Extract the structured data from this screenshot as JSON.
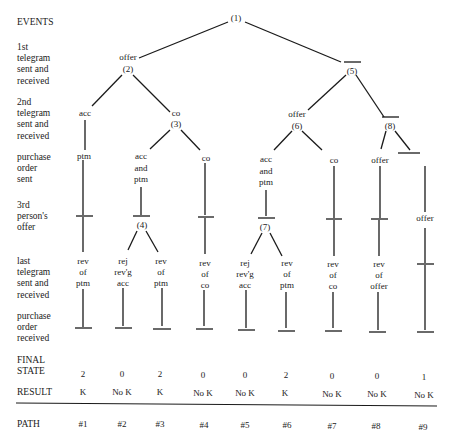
{
  "row_labels": {
    "events": "EVENTS",
    "first_telegram": [
      "1st",
      "telegram",
      "sent and",
      "received"
    ],
    "second_telegram": [
      "2nd",
      "telegram",
      "sent and",
      "received"
    ],
    "po_sent": [
      "purchase",
      "order",
      "sent"
    ],
    "third_offer": [
      "3rd",
      "person's",
      "offer"
    ],
    "last_telegram": [
      "last",
      "telegram",
      "sent and",
      "received"
    ],
    "po_received": [
      "purchase",
      "order",
      "received"
    ],
    "final_state": [
      "FINAL",
      "STATE"
    ],
    "result": "RESULT",
    "path": "PATH"
  },
  "nodes": {
    "n1": "(1)",
    "n2_event": "offer",
    "n2": "(2)",
    "n5": "(5)",
    "acc_a": "acc",
    "n3_event": "co",
    "n3": "(3)",
    "n6_event": "offer",
    "n6": "(6)",
    "n8": "(8)",
    "ptm_1": "ptm",
    "accptm_3": [
      "acc",
      "and",
      "ptm"
    ],
    "co_4": "co",
    "accptm_6": [
      "acc",
      "and",
      "ptm"
    ],
    "co_7": "co",
    "offer_8": "offer",
    "offer_9": "offer",
    "n4": "(4)",
    "n7": "(7)"
  },
  "last_telegram": [
    [
      "rev",
      "of",
      "ptm"
    ],
    [
      "rej",
      "rev'g",
      "acc"
    ],
    [
      "rev",
      "of",
      "ptm"
    ],
    [
      "rev",
      "of",
      "co"
    ],
    [
      "rej",
      "rev'g",
      "acc"
    ],
    [
      "rev",
      "of",
      "ptm"
    ],
    [
      "rev",
      "of",
      "co"
    ],
    [
      "rev",
      "of",
      "offer"
    ],
    []
  ],
  "final_state": [
    "2",
    "0",
    "2",
    "0",
    "0",
    "2",
    "0",
    "0",
    "1"
  ],
  "result": [
    "K",
    "No K",
    "K",
    "No K",
    "No K",
    "K",
    "No K",
    "No K",
    "No K"
  ],
  "paths": [
    "#1",
    "#2",
    "#3",
    "#4",
    "#5",
    "#6",
    "#7",
    "#8",
    "#9"
  ]
}
